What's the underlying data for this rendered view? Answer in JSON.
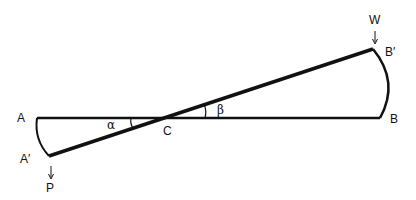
{
  "diagram": {
    "type": "lever / rotated beam geometry",
    "labels": {
      "A": "A",
      "A_prime": "A′",
      "B": "B",
      "B_prime": "B′",
      "C": "C",
      "W": "W",
      "P": "P",
      "alpha": "α",
      "beta": "β",
      "arrow_down": "↓"
    },
    "points": {
      "A": [
        37,
        118
      ],
      "A_prime": [
        49,
        156
      ],
      "B": [
        380,
        118
      ],
      "B_prime": [
        373,
        49
      ],
      "C": [
        162,
        118
      ]
    },
    "colors": {
      "stroke": "#111111",
      "background": "#ffffff"
    }
  }
}
